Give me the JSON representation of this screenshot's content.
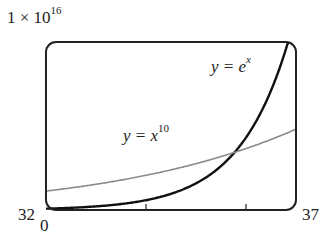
{
  "chart_data": {
    "type": "line",
    "title": "",
    "xlabel": "",
    "ylabel": "",
    "xlim": [
      32,
      37
    ],
    "ylim": [
      0,
      1e+16
    ],
    "grid": false,
    "x_ticks": [
      32,
      34,
      36,
      37
    ],
    "x_tick_labels": {
      "left": "32",
      "right": "37"
    },
    "y_tick_labels": {
      "bottom": "0",
      "top_base": "1 × 10",
      "top_exp": "16"
    },
    "series": [
      {
        "name": "y = e^x",
        "label_lhs": "y = e",
        "label_exp": "x",
        "color": "#111111",
        "x": [
          32,
          33,
          34,
          35,
          35.5,
          36,
          36.5,
          37
        ],
        "values": [
          79000000000000.0,
          210000000000000.0,
          580000000000000.0,
          1590000000000000.0,
          2620000000000000.0,
          4310000000000000.0,
          7100000000000000.0,
          1.17e+16
        ]
      },
      {
        "name": "y = x^10",
        "label_lhs": "y = x",
        "label_exp": "10",
        "color": "#8a8a8a",
        "x": [
          32,
          33,
          34,
          35,
          36,
          37
        ],
        "values": [
          1130000000000000.0,
          1530000000000000.0,
          2060000000000000.0,
          2760000000000000.0,
          3660000000000000.0,
          4810000000000000.0
        ]
      }
    ],
    "annotations": [
      "intersection near x ≈ 35.8"
    ]
  }
}
